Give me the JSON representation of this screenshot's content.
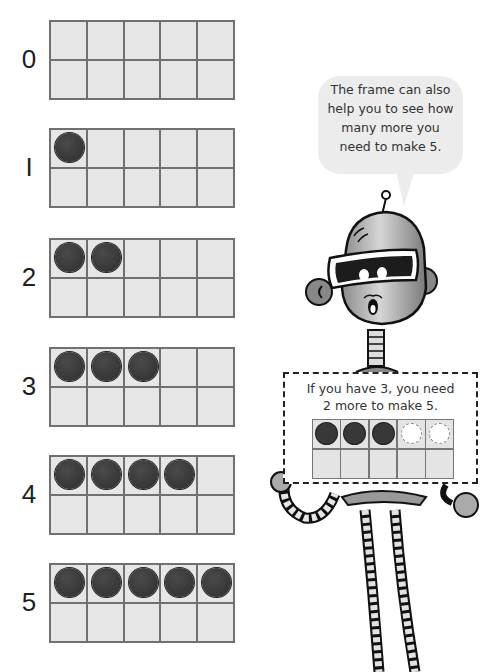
{
  "ten_frames": [
    {
      "label": "0",
      "filled": 0,
      "top": 20
    },
    {
      "label": "I",
      "filled": 1,
      "top": 128
    },
    {
      "label": "2",
      "filled": 2,
      "top": 238
    },
    {
      "label": "3",
      "filled": 3,
      "top": 347
    },
    {
      "label": "4",
      "filled": 4,
      "top": 455
    },
    {
      "label": "5",
      "filled": 5,
      "top": 563
    }
  ],
  "speech_bubble": {
    "lines": [
      "The frame can also",
      "help you to see how",
      "many more you",
      "need to make 5."
    ]
  },
  "sign": {
    "lines": [
      "If you have 3, you need",
      "2 more to make 5."
    ],
    "example_frame": {
      "filled": 3,
      "dashed_empty": 2,
      "total_top_row": 5
    }
  },
  "colors": {
    "cell_fill": "#e6e6e6",
    "grid_line": "#707070",
    "counter": "#333333",
    "bubble": "#ececec"
  }
}
